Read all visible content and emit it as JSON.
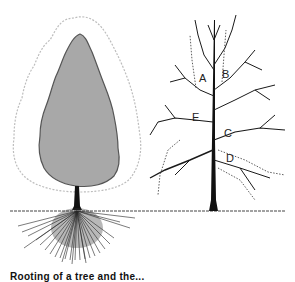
{
  "figure": {
    "left_tree": {
      "description": "Tree with shaded crown, dotted outer crown outline, trunk and root system below ground",
      "crown_fill": "#a8a8a8",
      "crown_outline": "#555555",
      "outer_outline": "#bdbdbd",
      "root_color": "#222222"
    },
    "right_tree": {
      "description": "Bare deciduous tree branching structure with labeled points",
      "branch_color": "#1a1a1a",
      "labels": [
        "A",
        "B",
        "C",
        "D",
        "E"
      ]
    },
    "ground_line_color": "#444444"
  },
  "caption": {
    "text": "Rooting of a tree and the..."
  }
}
